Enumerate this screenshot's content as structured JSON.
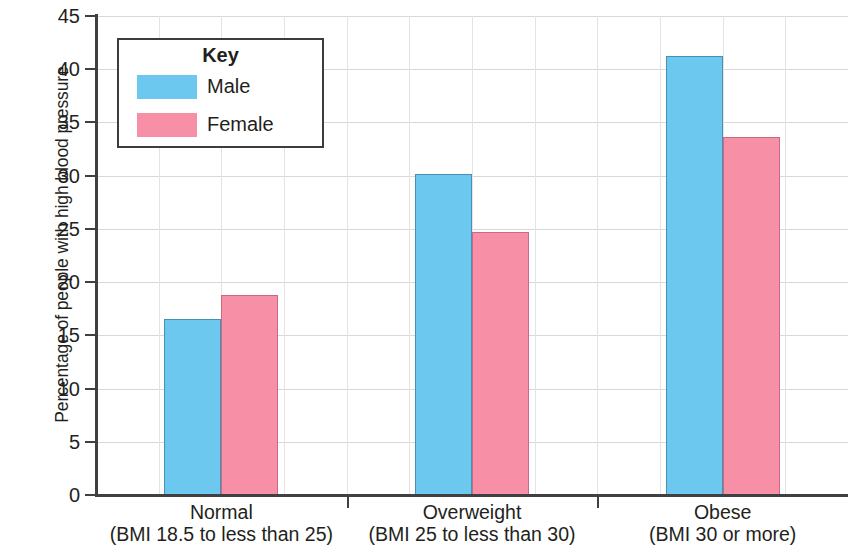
{
  "chart_data": {
    "type": "bar",
    "title": "",
    "xlabel": "",
    "ylabel": "Percentage of people with high blood pressure",
    "ylim": [
      0,
      45
    ],
    "ytick_step": 5,
    "yticks": [
      "45",
      "40",
      "35",
      "30",
      "25",
      "20",
      "15",
      "10",
      "5",
      "0"
    ],
    "grid": "horizontal and vertical",
    "legend_position": "upper-left inside plot",
    "legend_title": "Key",
    "categories": [
      "Normal",
      "Overweight",
      "Obese"
    ],
    "category_sublabels": [
      "(BMI 18.5 to less than 25)",
      "(BMI 25 to less than 30)",
      "(BMI 30 or more)"
    ],
    "series": [
      {
        "name": "Male",
        "color": "#6cc8ee",
        "values": [
          16.5,
          30.2,
          41.2
        ]
      },
      {
        "name": "Female",
        "color": "#f78fa6",
        "values": [
          18.8,
          24.7,
          33.6
        ]
      }
    ]
  },
  "colors": {
    "male": "#6cc8ee",
    "male_border": "#4a8fae",
    "female": "#f78fa6",
    "female_border": "#c96a80",
    "axis": "#403f41",
    "gridline": "#d9d9d9",
    "text": "#231f20",
    "legend_border": "#3c3c3c",
    "background": "#ffffff"
  }
}
